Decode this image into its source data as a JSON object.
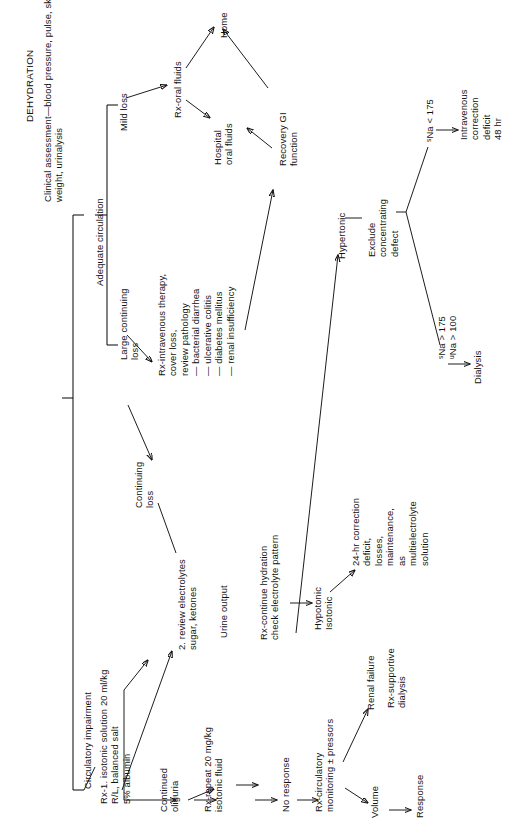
{
  "figure": {
    "title": "DEHYDRATION",
    "subtitle": "Clinical assessment—blood pressure, pulse, skin\nweight, urinalysis",
    "orientation": "rotated-90-counterclockwise",
    "type": "clinical-management-flowchart"
  },
  "nodes": {
    "dehydration": "DEHYDRATION",
    "clinical_assessment": "Clinical assessment—blood pressure, pulse, skin\nweight, urinalysis",
    "adequate_circulation": "Adequate circulation",
    "circulatory_impairment": "Circulatory impairment",
    "mild_loss": "Mild loss",
    "large_continuing_loss": "Large continuing\nloss",
    "continuing_loss": "Continuing\nloss",
    "rx_oral_fluids": "Rx-oral fluids",
    "home": "Home",
    "hospital_oral_fluids": "Hospital\noral fluids",
    "recovery_gi_function": "Recovery GI\nfunction",
    "rx_intravenous_therapy": "Rx-intravenous therapy,\ncover loss,\nreview pathology\n— bacterial diarrhea\n— ulcerative colitis\n— diabetes mellitus\n— renal insufficiency",
    "rx_isotonic_solution": "Rx-1. isotonic solution 20 ml/kg\nR/L, balanced salt\n5% albumin",
    "review_electrolytes": "2. review electrolytes\nsugar, ketones",
    "urine_output": "Urine output",
    "rx_continue_hydration": "Rx-continue hydration\ncheck electrolyte pattern",
    "hypotonic_isotonic": "Hypotonic\nIsotonic",
    "hypertonic": "Hypertonic",
    "exclude_concentrating_defect": "Exclude\nconcentrating\ndefect",
    "correction_24hr": "24-hr correction\ndeficit,\nlosses,\nmaintenance,\nas\nmultielectrolyte\nsolution",
    "sna_lt_175": "Na < 175",
    "sna_lt_175_sub": "s",
    "intravenous_correction": "Intravenous\ncorrection\ndeficit\n48 hr",
    "sna_gt_175": "Na > 175",
    "sna_gt_175_sub": "s",
    "una_gt_100": "Na > 100",
    "una_gt_100_sub": "u",
    "dialysis": "Dialysis",
    "continued_oliguria": "Continued\noliguria",
    "rx_repeat": "Rx-repeat 20 mg/kg\nisotonic fluid",
    "no_response": "No response",
    "rx_circulatory_monitoring": "Rx-circulatory\nmonitoring ± pressors",
    "renal_failure": "Renal failure",
    "rx_supportive_dialysis": "Rx-supportive\ndialysis",
    "volume": "Volume",
    "response": "Response"
  },
  "edges": [
    {
      "from": "clinical_assessment",
      "to": "adequate_circulation",
      "kind": "bracket"
    },
    {
      "from": "clinical_assessment",
      "to": "circulatory_impairment",
      "kind": "bracket"
    },
    {
      "from": "adequate_circulation",
      "to": "mild_loss",
      "kind": "bracket"
    },
    {
      "from": "adequate_circulation",
      "to": "large_continuing_loss",
      "kind": "bracket"
    },
    {
      "from": "mild_loss",
      "to": "rx_oral_fluids",
      "kind": "arrow"
    },
    {
      "from": "rx_oral_fluids",
      "to": "home",
      "kind": "arrow"
    },
    {
      "from": "rx_oral_fluids",
      "to": "hospital_oral_fluids",
      "kind": "arrow"
    },
    {
      "from": "hospital_oral_fluids",
      "to": "home",
      "kind": "arrow"
    },
    {
      "from": "recovery_gi_function",
      "to": "hospital_oral_fluids",
      "kind": "arrow"
    },
    {
      "from": "large_continuing_loss",
      "to": "rx_intravenous_therapy",
      "kind": "arrow"
    },
    {
      "from": "rx_intravenous_therapy",
      "to": "recovery_gi_function",
      "kind": "arrow"
    },
    {
      "from": "circulatory_impairment",
      "to": "rx_isotonic_solution",
      "kind": "line"
    },
    {
      "from": "rx_isotonic_solution",
      "to": "review_electrolytes",
      "kind": "arrow"
    },
    {
      "from": "rx_isotonic_solution",
      "to": "continued_oliguria",
      "kind": "arrow"
    },
    {
      "from": "continuing_loss",
      "to": "review_electrolytes",
      "kind": "line"
    },
    {
      "from": "rx_intravenous_therapy",
      "to": "continuing_loss",
      "kind": "arrow"
    },
    {
      "from": "review_electrolytes",
      "to": "urine_output",
      "kind": "arrow"
    },
    {
      "from": "urine_output",
      "to": "rx_continue_hydration",
      "kind": "arrow"
    },
    {
      "from": "rx_continue_hydration",
      "to": "hypotonic_isotonic",
      "kind": "arrow"
    },
    {
      "from": "rx_continue_hydration",
      "to": "hypertonic",
      "kind": "arrow"
    },
    {
      "from": "hypotonic_isotonic",
      "to": "correction_24hr",
      "kind": "arrow"
    },
    {
      "from": "hypertonic",
      "to": "exclude_concentrating_defect",
      "kind": "line"
    },
    {
      "from": "exclude_concentrating_defect",
      "to": "sna_lt_175",
      "kind": "branch"
    },
    {
      "from": "exclude_concentrating_defect",
      "to": "sna_gt_175",
      "kind": "branch"
    },
    {
      "from": "sna_lt_175",
      "to": "intravenous_correction",
      "kind": "arrow"
    },
    {
      "from": "sna_gt_175",
      "to": "dialysis",
      "kind": "arrow"
    },
    {
      "from": "continued_oliguria",
      "to": "rx_repeat",
      "kind": "arrow"
    },
    {
      "from": "rx_repeat",
      "to": "no_response",
      "kind": "arrow"
    },
    {
      "from": "no_response",
      "to": "rx_circulatory_monitoring",
      "kind": "arrow"
    },
    {
      "from": "rx_circulatory_monitoring",
      "to": "renal_failure",
      "kind": "arrow"
    },
    {
      "from": "rx_circulatory_monitoring",
      "to": "volume",
      "kind": "arrow"
    },
    {
      "from": "volume",
      "to": "response",
      "kind": "arrow"
    },
    {
      "from": "renal_failure",
      "to": "rx_supportive_dialysis",
      "kind": "implied"
    }
  ],
  "colors": {
    "ink": "#111111",
    "background": "#ffffff"
  }
}
